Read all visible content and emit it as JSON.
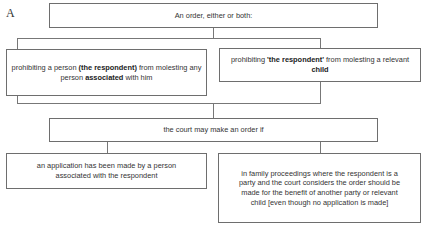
{
  "figure_label": "A",
  "nodes": {
    "top": {
      "text": "An order, either or both:"
    },
    "left_order": {
      "parts": [
        "prohibiting a person ",
        "(the respondent)",
        " from molesting any person ",
        "associated",
        " with him"
      ]
    },
    "right_order": {
      "parts": [
        "prohibiting ",
        "'the respondent'",
        " from molesting a relevant ",
        "child"
      ]
    },
    "middle": {
      "text": "the court may make an order if"
    },
    "left_condition": {
      "text": "an application has been made by a person associated with the respondent"
    },
    "right_condition": {
      "text": "in family proceedings where the respondent is a party and the court considers the order should be made for the benefit of another party or relevant child [even though no application is made]"
    }
  },
  "colors": {
    "border": "#6e6e6e",
    "text": "#333333",
    "background": "#ffffff"
  }
}
